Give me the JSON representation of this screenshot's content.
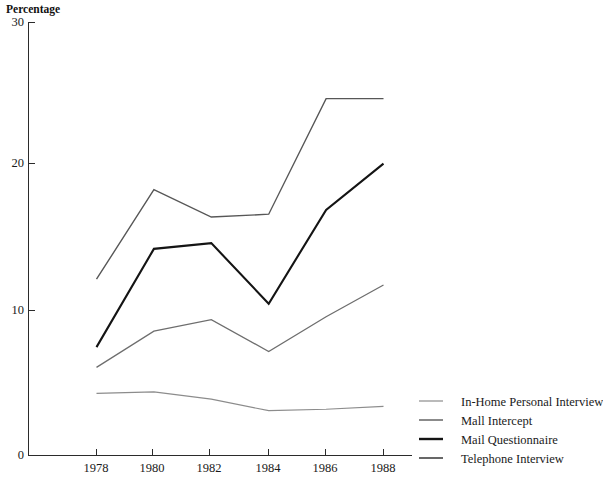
{
  "chart_data": {
    "type": "line",
    "title": "",
    "ylabel": "Percentage",
    "xlabel": "",
    "categories": [
      "1978",
      "1980",
      "1982",
      "1984",
      "1986",
      "1988"
    ],
    "x": [
      1978,
      1980,
      1982,
      1984,
      1986,
      1988
    ],
    "xlim": [
      1977,
      1989
    ],
    "ylim": [
      0,
      30
    ],
    "yticks": [
      0,
      10,
      20,
      30
    ],
    "ytick_labels": [
      "0",
      "10",
      "20",
      "30"
    ],
    "xticks": [
      1978,
      1980,
      1982,
      1984,
      1986,
      1988
    ],
    "xtick_labels": [
      "1978",
      "1980",
      "1982",
      "1984",
      "1986",
      "1988"
    ],
    "grid": false,
    "legend_position": "right",
    "series": [
      {
        "name": "In-Home Personal Interview",
        "values": [
          4.3,
          4.4,
          3.9,
          3.1,
          3.2,
          3.4
        ],
        "color": "#8c8c8c",
        "width": 1.2
      },
      {
        "name": "Mall Intercept",
        "values": [
          6.1,
          8.6,
          9.4,
          7.2,
          9.6,
          11.8
        ],
        "color": "#6e6e6e",
        "width": 1.3
      },
      {
        "name": "Mail Questionnaire",
        "values": [
          7.5,
          14.3,
          14.7,
          10.5,
          17.0,
          20.2
        ],
        "color": "#141414",
        "width": 2.1
      },
      {
        "name": "Telephone Interview",
        "values": [
          12.2,
          18.4,
          16.5,
          16.7,
          24.7,
          24.7
        ],
        "color": "#575757",
        "width": 1.4
      }
    ]
  },
  "axis": {
    "y_label": "Percentage",
    "y_ticks": [
      "30",
      "20",
      "10",
      "0"
    ],
    "x_ticks": [
      "1978",
      "1980",
      "1982",
      "1984",
      "1986",
      "1988"
    ]
  },
  "legend": {
    "items": [
      {
        "label": "In-Home Personal Interview",
        "color": "#8c8c8c",
        "width": 1.2
      },
      {
        "label": "Mall Intercept",
        "color": "#6e6e6e",
        "width": 1.6
      },
      {
        "label": "Mail Questionnaire",
        "color": "#141414",
        "width": 2.4
      },
      {
        "label": "Telephone Interview",
        "color": "#575757",
        "width": 1.8
      }
    ]
  },
  "colors": {
    "background": "#ffffff",
    "axis": "#2b2b2b",
    "text": "#1a1a1a"
  }
}
